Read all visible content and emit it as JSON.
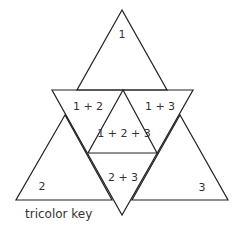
{
  "diagram": {
    "caption": "tricolor key",
    "regions": {
      "r1": "1",
      "r2": "2",
      "r3": "3",
      "r12": "1 + 2",
      "r13": "1 + 3",
      "r23": "2 + 3",
      "r123": "1 + 2 + 3"
    },
    "stroke_color": "#222222",
    "background": "#ffffff"
  }
}
